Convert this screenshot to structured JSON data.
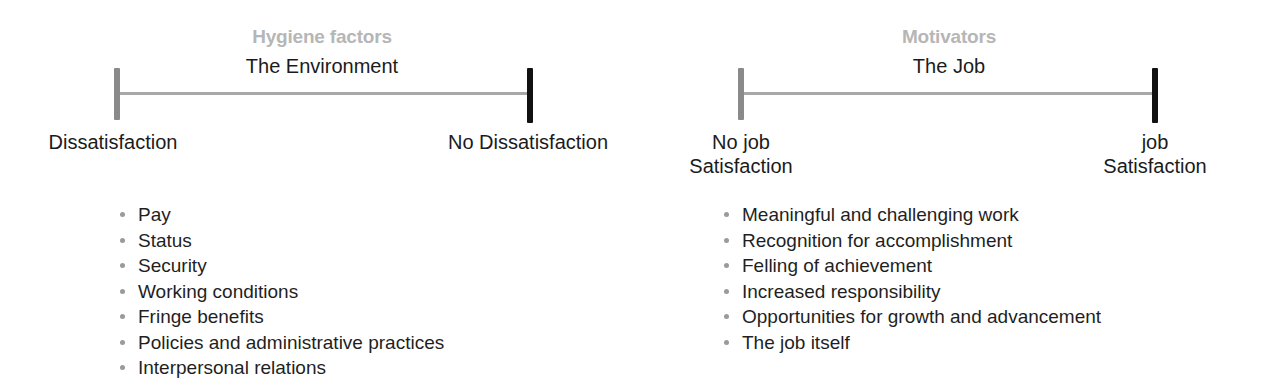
{
  "diagram": {
    "colors": {
      "category_heading": "#b6b6b6",
      "body_text": "#1b1b1b",
      "axis_line": "#a8a8a8",
      "cap_gray": "#8a8a8a",
      "cap_black": "#121212",
      "bullet": "#9a9a9a",
      "background": "#ffffff"
    }
  },
  "panels": [
    {
      "id": "hygiene",
      "category_heading": "Hygiene factors",
      "domain_heading": "The Environment",
      "left_endpoint": {
        "line1": "Dissatisfaction",
        "line2": ""
      },
      "right_endpoint": {
        "line1": "No Dissatisfaction",
        "line2": ""
      },
      "factors": [
        "Pay",
        "Status",
        "Security",
        "Working conditions",
        "Fringe benefits",
        "Policies and administrative practices",
        "Interpersonal relations"
      ]
    },
    {
      "id": "motivators",
      "category_heading": "Motivators",
      "domain_heading": "The Job",
      "left_endpoint": {
        "line1": "No job",
        "line2": "Satisfaction"
      },
      "right_endpoint": {
        "line1": "job",
        "line2": "Satisfaction"
      },
      "factors": [
        "Meaningful and challenging work",
        "Recognition for accomplishment",
        "Felling of achievement",
        "Increased responsibility",
        "Opportunities for growth and advancement",
        "The job itself"
      ]
    }
  ]
}
